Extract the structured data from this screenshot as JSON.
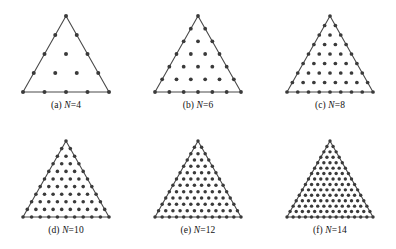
{
  "figure": {
    "background_color": "#ffffff",
    "ink_color": "#2b2b2b",
    "dot_color": "#3a3a3a",
    "edge_color": "#4a4a4a",
    "panels": [
      {
        "id": "panel-a",
        "tag": "(a)",
        "variable": "N",
        "equals": "=",
        "value": "4",
        "caption": "(a) N=4",
        "order": 4,
        "node_count": 15,
        "boundary_nodes": 12,
        "interior_nodes": 3,
        "dot_radius": 2.0,
        "line_width": 1.1
      },
      {
        "id": "panel-b",
        "tag": "(b)",
        "variable": "N",
        "equals": "=",
        "value": "6",
        "caption": "(b) N=6",
        "order": 6,
        "node_count": 28,
        "boundary_nodes": 18,
        "interior_nodes": 10,
        "dot_radius": 1.9,
        "line_width": 1.1
      },
      {
        "id": "panel-c",
        "tag": "(c)",
        "variable": "N",
        "equals": "=",
        "value": "8",
        "caption": "(c) N=8",
        "order": 8,
        "node_count": 45,
        "boundary_nodes": 24,
        "interior_nodes": 21,
        "dot_radius": 1.85,
        "line_width": 1.1
      },
      {
        "id": "panel-d",
        "tag": "(d)",
        "variable": "N",
        "equals": "=",
        "value": "10",
        "caption": "(d) N=10",
        "order": 10,
        "node_count": 66,
        "boundary_nodes": 30,
        "interior_nodes": 36,
        "dot_radius": 1.8,
        "line_width": 1.1
      },
      {
        "id": "panel-e",
        "tag": "(e)",
        "variable": "N",
        "equals": "=",
        "value": "12",
        "caption": "(e) N=12",
        "order": 12,
        "node_count": 91,
        "boundary_nodes": 36,
        "interior_nodes": 55,
        "dot_radius": 1.75,
        "line_width": 1.1
      },
      {
        "id": "panel-f",
        "tag": "(f)",
        "variable": "N",
        "equals": "=",
        "value": "14",
        "caption": "(f) N=14",
        "order": 14,
        "node_count": 120,
        "boundary_nodes": 42,
        "interior_nodes": 78,
        "dot_radius": 1.7,
        "line_width": 1.1
      }
    ],
    "geometry": {
      "triangle_width": 86,
      "triangle_height": 76,
      "canvas_width": 126,
      "canvas_height": 92,
      "apex_offset_x": 63,
      "apex_offset_y": 8
    }
  }
}
